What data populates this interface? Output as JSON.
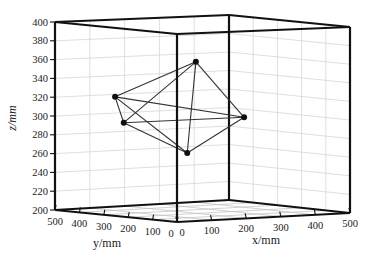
{
  "chart_data": {
    "type": "scatter",
    "subtype": "3d-graph",
    "title": "",
    "xlabel": "x/mm",
    "ylabel": "y/mm",
    "zlabel": "z/mm",
    "xlim": [
      0,
      500
    ],
    "ylim": [
      0,
      500
    ],
    "zlim": [
      200,
      400
    ],
    "xticks": [
      "0",
      "100",
      "200",
      "300",
      "400",
      "500"
    ],
    "yticks": [
      "500",
      "400",
      "300",
      "200",
      "100",
      "0"
    ],
    "zticks": [
      "400",
      "380",
      "360",
      "340",
      "320",
      "300",
      "280",
      "260",
      "240",
      "220",
      "200"
    ],
    "grid": true,
    "legend": "none",
    "points": [
      {
        "name": "P1",
        "x": 160,
        "y": 150,
        "z": 364
      },
      {
        "name": "P2",
        "x": 50,
        "y": 325,
        "z": 324
      },
      {
        "name": "P3",
        "x": 75,
        "y": 325,
        "z": 296
      },
      {
        "name": "P4",
        "x": 215,
        "y": 30,
        "z": 307
      },
      {
        "name": "P5",
        "x": 100,
        "y": 100,
        "z": 269
      }
    ],
    "edges": [
      [
        0,
        1
      ],
      [
        0,
        2
      ],
      [
        0,
        3
      ],
      [
        0,
        4
      ],
      [
        1,
        2
      ],
      [
        1,
        3
      ],
      [
        1,
        4
      ],
      [
        2,
        3
      ],
      [
        2,
        4
      ],
      [
        3,
        4
      ]
    ],
    "colors": {
      "edge": "#333333",
      "node": "#111111",
      "box": "#111111",
      "grid": "#d6d6d6"
    }
  }
}
